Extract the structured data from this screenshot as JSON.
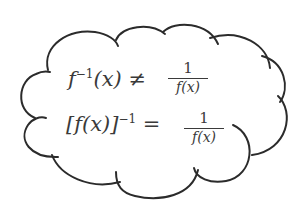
{
  "diagram": {
    "shape": "thought-cloud",
    "stroke_color": "#2b2b2b",
    "text_color": "#3a3a3a",
    "background": "#ffffff"
  },
  "equations": [
    {
      "lhs_base": "f",
      "lhs_sup": "−1",
      "lhs_arg": "(x)",
      "relation": "≠",
      "rhs_numerator": "1",
      "rhs_denominator": "f(x)"
    },
    {
      "lhs_base": "[f(x)]",
      "lhs_sup": "−1",
      "lhs_arg": "",
      "relation": "=",
      "rhs_numerator": "1",
      "rhs_denominator": "f(x)"
    }
  ]
}
